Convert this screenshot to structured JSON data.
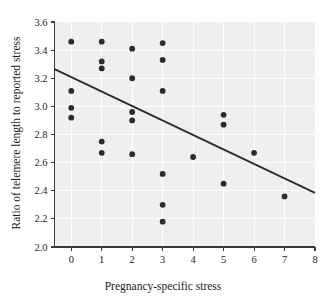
{
  "chart_data": {
    "type": "scatter",
    "title": "",
    "xlabel": "Pregnancy-specific stress",
    "ylabel": "Ratio of telemere length to reported stress",
    "xlim": [
      -0.55,
      8
    ],
    "ylim": [
      2.0,
      3.6
    ],
    "xticks": [
      0,
      1,
      2,
      3,
      4,
      5,
      6,
      7,
      8
    ],
    "xtick_labels": [
      "0",
      "1",
      "2",
      "3",
      "4",
      "5",
      "6",
      "7",
      "8"
    ],
    "yticks": [
      2.0,
      2.2,
      2.4,
      2.6,
      2.8,
      3.0,
      3.2,
      3.4,
      3.6
    ],
    "ytick_labels": [
      "2.0",
      "2.2",
      "2.4",
      "2.6",
      "2.8",
      "3.0",
      "3.2",
      "3.4",
      "3.6"
    ],
    "grid": true,
    "legend": false,
    "background_color": "#efefef",
    "gridline_color": "#ffffff",
    "point_color": "#2b2b2b",
    "line_color": "#2b2b2b",
    "points": [
      {
        "x": 0,
        "y": 3.46
      },
      {
        "x": 0,
        "y": 3.11
      },
      {
        "x": 0,
        "y": 2.99
      },
      {
        "x": 0,
        "y": 2.92
      },
      {
        "x": 1,
        "y": 3.46
      },
      {
        "x": 1,
        "y": 3.32
      },
      {
        "x": 1,
        "y": 3.27
      },
      {
        "x": 1,
        "y": 2.75
      },
      {
        "x": 1,
        "y": 2.67
      },
      {
        "x": 2,
        "y": 3.41
      },
      {
        "x": 2,
        "y": 3.2
      },
      {
        "x": 2,
        "y": 2.96
      },
      {
        "x": 2,
        "y": 2.9
      },
      {
        "x": 2,
        "y": 2.66
      },
      {
        "x": 3,
        "y": 3.45
      },
      {
        "x": 3,
        "y": 3.33
      },
      {
        "x": 3,
        "y": 3.11
      },
      {
        "x": 3,
        "y": 2.52
      },
      {
        "x": 3,
        "y": 2.3
      },
      {
        "x": 3,
        "y": 2.18
      },
      {
        "x": 4,
        "y": 2.64
      },
      {
        "x": 5,
        "y": 2.94
      },
      {
        "x": 5,
        "y": 2.87
      },
      {
        "x": 5,
        "y": 2.45
      },
      {
        "x": 6,
        "y": 2.67
      },
      {
        "x": 7,
        "y": 2.36
      }
    ],
    "trend_line": {
      "x_start": -0.55,
      "y_start": 3.265,
      "x_end": 8.0,
      "y_end": 2.385
    }
  }
}
